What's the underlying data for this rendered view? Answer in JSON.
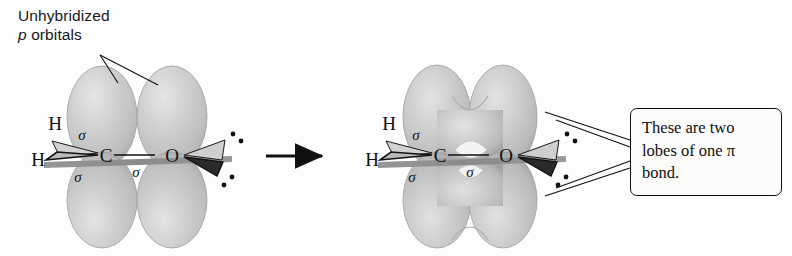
{
  "figure": {
    "background_color": "#fdfdfd"
  },
  "annotations": {
    "unhybridized_line1": "Unhybridized",
    "unhybridized_p": "p",
    "unhybridized_line2": " orbitals",
    "callout_line1": "These are two",
    "callout_line2a": "lobes of one ",
    "callout_pi": "π",
    "callout_line3": "bond."
  },
  "left_structure": {
    "name": "separate-p-orbitals",
    "atoms": {
      "hydrogen_top": "H",
      "hydrogen_bottom": "H",
      "carbon": "C",
      "oxygen": "O"
    },
    "bond_labels": {
      "sigma_ch_top": "σ",
      "sigma_ch_bottom": "σ",
      "sigma_co": "σ"
    },
    "lone_pairs": 2,
    "lobe_count": 4
  },
  "right_structure": {
    "name": "overlapped-pi-bond",
    "atoms": {
      "hydrogen_top": "H",
      "hydrogen_bottom": "H",
      "carbon": "C",
      "oxygen": "O"
    },
    "bond_labels": {
      "sigma_ch_top": "σ",
      "sigma_ch_bottom": "σ",
      "sigma_co": "σ"
    },
    "lone_pairs": 2,
    "lobe_count": 2
  },
  "arrow": {
    "name": "transformation-arrow",
    "direction": "right"
  },
  "colors": {
    "orbital_fill": "#c9c9c9",
    "orbital_edge": "#9b9b9b",
    "orbital_highlight": "#e2e2e2",
    "plane_bar": "#8d8d8d",
    "ink": "#111111",
    "background": "#fdfdfd"
  }
}
